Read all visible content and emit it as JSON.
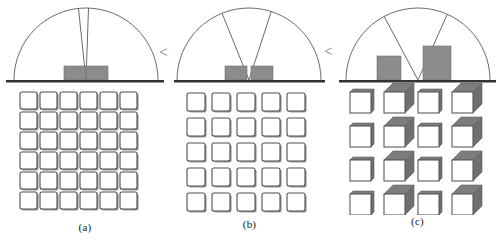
{
  "figure": {
    "background_color": "#ffffff",
    "ink_color": "#5a5a5a",
    "fill_color": "#8c8c8c",
    "baseline_color": "#333333",
    "comparison_symbol_1": "<",
    "comparison_symbol_2": "<",
    "panels": [
      {
        "id": "a",
        "label": "(a)",
        "arc": {
          "center_x": 86,
          "baseline_y": 80,
          "radius": 72,
          "start_angle": 180,
          "end_angle": 360
        },
        "wedge": {
          "angle_deg": 8,
          "bisector_deg": 92
        },
        "bars": [
          {
            "x": 64,
            "width": 22,
            "height": 14
          },
          {
            "x": 86,
            "width": 22,
            "height": 14
          }
        ],
        "grid": {
          "rows": 6,
          "cols": 6,
          "cell": 17,
          "gap": 3,
          "style": "flat",
          "origin_x": 20,
          "origin_y": 92
        }
      },
      {
        "id": "b",
        "label": "(b)",
        "arc": {
          "center_x": 81,
          "baseline_y": 80,
          "radius": 72,
          "start_angle": 180,
          "end_angle": 360
        },
        "wedge": {
          "angle_deg": 40,
          "bisector_deg": 92
        },
        "bars": [
          {
            "x": 57,
            "width": 22,
            "height": 14
          },
          {
            "x": 83,
            "width": 22,
            "height": 14
          }
        ],
        "grid": {
          "rows": 5,
          "cols": 5,
          "cell": 18,
          "gap": 7,
          "style": "flat",
          "origin_x": 19,
          "origin_y": 93
        }
      },
      {
        "id": "c",
        "label": "(c)",
        "arc": {
          "center_x": 85,
          "baseline_y": 80,
          "radius": 72,
          "start_angle": 180,
          "end_angle": 360
        },
        "wedge": {
          "angle_deg": 52,
          "bisector_deg": 92
        },
        "bars": [
          {
            "x": 44,
            "width": 24,
            "height": 24
          },
          {
            "x": 90,
            "width": 28,
            "height": 34
          }
        ],
        "grid": {
          "rows": 4,
          "cols": 4,
          "cell": 21,
          "gap": 13,
          "style": "cube",
          "origin_x": 17,
          "origin_y": 92,
          "depth_pattern": [
            3,
            9,
            3,
            9
          ]
        }
      }
    ]
  }
}
